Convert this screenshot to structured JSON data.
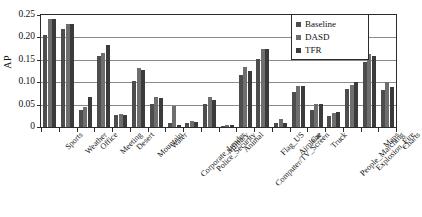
{
  "chart_data": {
    "type": "bar",
    "title": "",
    "xlabel": "",
    "ylabel": "AP",
    "ylim": [
      0,
      0.25
    ],
    "ytick_labels": [
      "0.25",
      "0.20",
      "0.15",
      "0.10",
      "0.05",
      "0"
    ],
    "ytick_values": [
      0.25,
      0.2,
      0.15,
      0.1,
      0.05,
      0
    ],
    "grid": true,
    "legend_position": "top-right",
    "categories": [
      "Sports",
      "Weather",
      "Office",
      "Meeting",
      "Desert",
      "Mountain",
      "Water",
      "Corporate_Leader",
      "Police_Security",
      "Military",
      "Animal",
      "Computer/TV_Screen",
      "Flag_US",
      "Airplane",
      "Car",
      "Truck",
      "People_Marching",
      "Explosion_Fire",
      "Maps",
      "Charts"
    ],
    "series": [
      {
        "name": "Baseline",
        "color": "#4d4d4d",
        "values": [
          0.205,
          0.219,
          0.038,
          0.158,
          0.026,
          0.103,
          0.051,
          0.008,
          0.008,
          0.051,
          0.003,
          0.115,
          0.152,
          0.008,
          0.079,
          0.039,
          0.025,
          0.084,
          0.146,
          0.083
        ]
      },
      {
        "name": "DASD",
        "color": "#6e6e6e",
        "values": [
          0.241,
          0.229,
          0.044,
          0.166,
          0.028,
          0.132,
          0.066,
          0.047,
          0.014,
          0.066,
          0.005,
          0.135,
          0.175,
          0.018,
          0.091,
          0.051,
          0.032,
          0.094,
          0.164,
          0.1
        ]
      },
      {
        "name": "TFR",
        "color": "#3b3b3b",
        "values": [
          0.24,
          0.229,
          0.067,
          0.182,
          0.027,
          0.127,
          0.065,
          0.004,
          0.012,
          0.06,
          0.005,
          0.125,
          0.174,
          0.01,
          0.092,
          0.052,
          0.034,
          0.101,
          0.158,
          0.09
        ]
      }
    ]
  },
  "legend": {
    "items": [
      {
        "label": "Baseline"
      },
      {
        "label": "DASD"
      },
      {
        "label": "TFR"
      }
    ]
  }
}
